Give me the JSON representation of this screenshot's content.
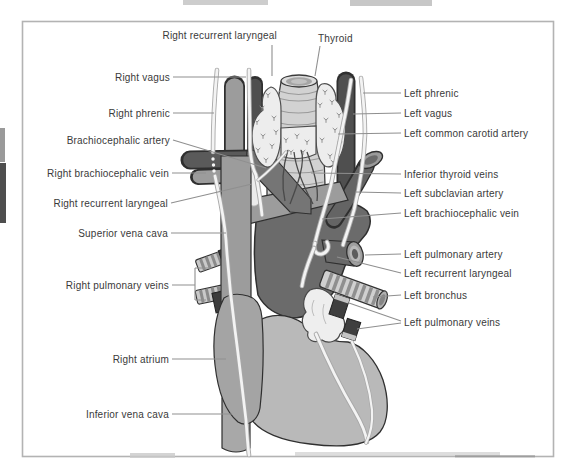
{
  "figure": {
    "palette": {
      "background": "#ffffff",
      "frame": "#b3b3b3",
      "label_text": "#3a3a3a",
      "leader_line": "#8f8f8f",
      "artery_dark": "#4f4f4f",
      "aorta": "#6b6b6b",
      "brachiocephalic_artery": "#757575",
      "vein": "#9c9c9c",
      "right_atrium": "#a4a4a4",
      "heart_ventricles": "#b9b9b9",
      "thyroid": "#ededed",
      "trachea": "#d2d2d2",
      "nerve": "#f3f3f3",
      "bronchus_stripe": "#8f8f8f",
      "pulmonary_vein_dark": "#3f3f3f",
      "outline": "#2f2f2f"
    },
    "labels": [
      {
        "id": "right-recurrent-laryngeal-top",
        "side": "top-left",
        "text": "Right recurrent laryngeal"
      },
      {
        "id": "thyroid",
        "side": "top",
        "text": "Thyroid"
      },
      {
        "id": "right-vagus",
        "side": "left",
        "text": "Right vagus"
      },
      {
        "id": "right-phrenic",
        "side": "left",
        "text": "Right phrenic"
      },
      {
        "id": "brachiocephalic-artery",
        "side": "left",
        "text": "Brachiocephalic artery"
      },
      {
        "id": "right-brachiocephalic-vein",
        "side": "left",
        "text": "Right brachiocephalic vein"
      },
      {
        "id": "right-recurrent-laryngeal",
        "side": "left",
        "text": "Right recurrent laryngeal"
      },
      {
        "id": "superior-vena-cava",
        "side": "left",
        "text": "Superior vena cava"
      },
      {
        "id": "right-pulmonary-veins",
        "side": "left",
        "text": "Right pulmonary veins"
      },
      {
        "id": "right-atrium",
        "side": "left",
        "text": "Right atrium"
      },
      {
        "id": "inferior-vena-cava",
        "side": "left",
        "text": "Inferior vena cava"
      },
      {
        "id": "left-phrenic",
        "side": "right",
        "text": "Left phrenic"
      },
      {
        "id": "left-vagus",
        "side": "right",
        "text": "Left vagus"
      },
      {
        "id": "left-common-carotid-artery",
        "side": "right",
        "text": "Left common carotid artery"
      },
      {
        "id": "inferior-thyroid-veins",
        "side": "right",
        "text": "Inferior thyroid veins"
      },
      {
        "id": "left-subclavian-artery",
        "side": "right",
        "text": "Left subclavian artery"
      },
      {
        "id": "left-brachiocephalic-vein",
        "side": "right",
        "text": "Left brachiocephalic vein"
      },
      {
        "id": "left-pulmonary-artery",
        "side": "right",
        "text": "Left pulmonary artery"
      },
      {
        "id": "left-recurrent-laryngeal",
        "side": "right",
        "text": "Left recurrent laryngeal"
      },
      {
        "id": "left-bronchus",
        "side": "right",
        "text": "Left bronchus"
      },
      {
        "id": "left-pulmonary-veins",
        "side": "right",
        "text": "Left pulmonary veins"
      }
    ]
  }
}
